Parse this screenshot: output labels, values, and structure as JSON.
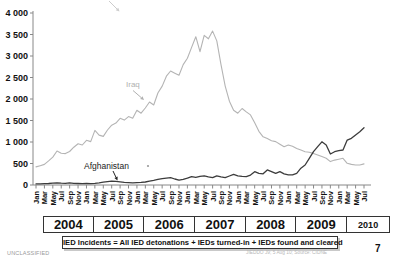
{
  "footer": {
    "classification": "UNCLASSIFIED",
    "caption": "IED Incidents = All IED detonations + IEDs turned-in + IEDs found and cleared",
    "source_note": "JIEDDO J9; 5 Aug 10; Source: CIDNE",
    "page_number": "7"
  },
  "chart_data": {
    "type": "line",
    "title": "",
    "xlabel": "",
    "ylabel": "",
    "grid": false,
    "legend_position": "inline-arrow-annotations",
    "y_axis": {
      "min": 0,
      "max": 4000,
      "step": 500,
      "tick_labels": [
        "0",
        "500",
        "1 000",
        "1 500",
        "2 000",
        "2 500",
        "3 000",
        "3 500",
        "4 000"
      ]
    },
    "x_axis": {
      "start": "Jan 2004",
      "end": "Jul 2010",
      "tick_interval_months": 2,
      "month_tick_labels": [
        "Jan",
        "Mar",
        "May",
        "Jul",
        "Sep",
        "Nov"
      ],
      "years": [
        {
          "label": "2004",
          "months": 12
        },
        {
          "label": "2005",
          "months": 12
        },
        {
          "label": "2006",
          "months": 12
        },
        {
          "label": "2007",
          "months": 12
        },
        {
          "label": "2008",
          "months": 12
        },
        {
          "label": "2009",
          "months": 12
        },
        {
          "label": "2010",
          "months": 7
        }
      ]
    },
    "annotations": [
      {
        "label": "Iraq",
        "color": "#b0b0b0"
      },
      {
        "label": "Afghanistan",
        "color": "#222222"
      }
    ],
    "series": [
      {
        "name": "Iraq",
        "color": "#b4b4b4",
        "values": [
          420,
          450,
          480,
          560,
          650,
          790,
          740,
          730,
          780,
          880,
          960,
          930,
          1040,
          1010,
          1270,
          1160,
          1130,
          1280,
          1390,
          1440,
          1550,
          1510,
          1590,
          1550,
          1740,
          1670,
          1790,
          1930,
          1860,
          2140,
          2300,
          2530,
          2650,
          2600,
          2550,
          2800,
          2950,
          3200,
          3450,
          3100,
          3480,
          3400,
          3580,
          3350,
          2800,
          2300,
          1950,
          1740,
          1670,
          1780,
          1700,
          1630,
          1450,
          1250,
          1120,
          1080,
          1030,
          1010,
          950,
          890,
          930,
          900,
          850,
          815,
          775,
          760,
          735,
          700,
          660,
          620,
          545,
          580,
          600,
          620,
          505,
          480,
          465,
          465,
          490
        ]
      },
      {
        "name": "Afghanistan",
        "color": "#3c3c3c",
        "values": [
          25,
          25,
          30,
          35,
          45,
          50,
          45,
          40,
          50,
          40,
          35,
          30,
          35,
          30,
          40,
          50,
          65,
          80,
          90,
          85,
          75,
          60,
          55,
          50,
          55,
          60,
          70,
          90,
          110,
          130,
          150,
          160,
          170,
          140,
          115,
          130,
          160,
          195,
          180,
          200,
          215,
          190,
          170,
          215,
          190,
          170,
          210,
          250,
          215,
          200,
          195,
          230,
          310,
          270,
          260,
          350,
          310,
          270,
          310,
          260,
          235,
          235,
          270,
          390,
          465,
          620,
          775,
          890,
          1005,
          930,
          720,
          775,
          800,
          815,
          1045,
          1085,
          1165,
          1240,
          1330
        ]
      }
    ]
  }
}
